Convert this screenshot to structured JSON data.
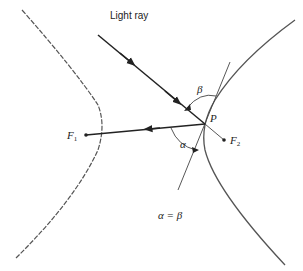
{
  "labels": {
    "light_ray": "Light ray",
    "point_p": "P",
    "focus1_main": "F",
    "focus1_sub": "1",
    "focus2_main": "F",
    "focus2_sub": "2",
    "alpha": "α",
    "beta": "β",
    "equation": "α = β"
  },
  "colors": {
    "stroke": "#333333",
    "curve": "#555555"
  }
}
